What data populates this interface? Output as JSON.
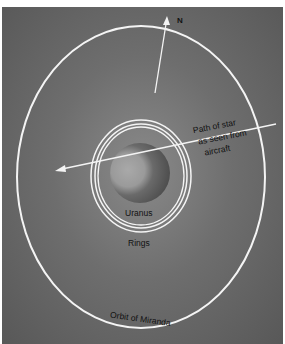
{
  "diagram": {
    "labels": {
      "north": "N",
      "star_path_line1": "Path of star",
      "star_path_line2": "as seen from",
      "star_path_line3": "aircraft",
      "planet": "Uranus",
      "rings": "Rings",
      "orbit": "Orbit of Miranda"
    },
    "colors": {
      "background": "#6e6e6e",
      "lines": "#f4f4f4",
      "text": "#111111"
    }
  }
}
